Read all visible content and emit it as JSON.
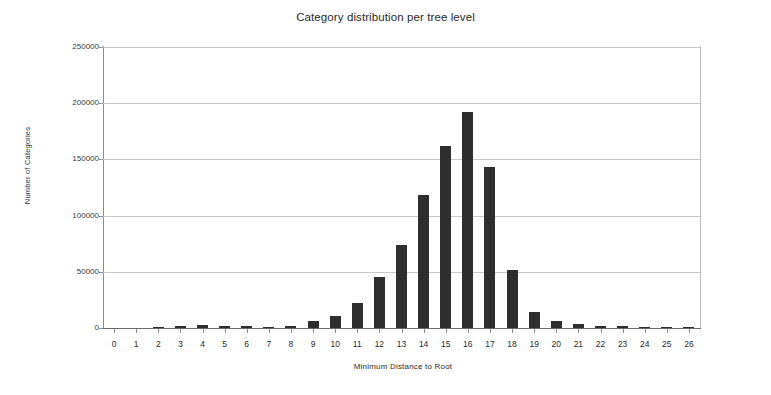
{
  "chart_data": {
    "type": "bar",
    "title": "Category distribution per tree level",
    "xlabel": "Minimum Distance to Root",
    "ylabel": "Number of Categories",
    "categories": [
      "0",
      "1",
      "2",
      "3",
      "4",
      "5",
      "6",
      "7",
      "8",
      "9",
      "10",
      "11",
      "12",
      "13",
      "14",
      "15",
      "16",
      "17",
      "18",
      "19",
      "20",
      "21",
      "22",
      "23",
      "24",
      "25",
      "26"
    ],
    "values": [
      0,
      0,
      300,
      1800,
      2600,
      2200,
      1400,
      900,
      1600,
      6000,
      11000,
      22000,
      45000,
      73500,
      118000,
      162000,
      192500,
      143000,
      52000,
      14000,
      6000,
      3200,
      1800,
      2200,
      1100,
      400,
      200
    ],
    "ylim": [
      0,
      250000
    ],
    "ytick_labels": [
      "0",
      "50000",
      "100000",
      "150000",
      "200000",
      "250000"
    ],
    "ytick_values": [
      0,
      50000,
      100000,
      150000,
      200000,
      250000
    ],
    "grid": true,
    "legend": null,
    "bar_color": "#2e2e2e",
    "grid_color": "#c8c8c8",
    "axis_color": "#8d8d8d"
  }
}
